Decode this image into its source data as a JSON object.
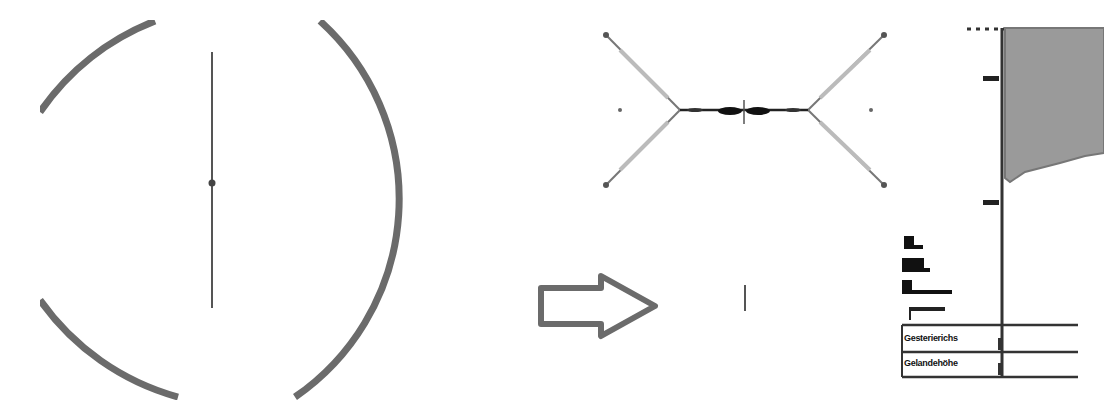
{
  "figure": {
    "panels": [
      {
        "id": "left",
        "description": "Circular cross-section with vertical line and center point"
      },
      {
        "id": "middle-top",
        "description": "X-shaped deformed structure with central horizontal band"
      },
      {
        "id": "middle-bottom",
        "description": "Short vertical tick"
      },
      {
        "id": "right",
        "description": "Profile plot with shaded region and labeled table"
      }
    ],
    "arrow": {
      "direction": "right",
      "color": "#6b6b6b"
    },
    "colors": {
      "stroke_dark": "#3a3a3a",
      "stroke_gray": "#6e6e6e",
      "fill_shaded": "#9a9a9a",
      "light_gray": "#b5b5b5"
    },
    "right_panel": {
      "legend_items": [
        "Ba",
        "Bkla",
        "Bhaaaa"
      ],
      "small_label": "gga.aaaa",
      "table_rows": [
        {
          "label": "Gesterierichs",
          "marker": "|"
        },
        {
          "label": "Gelandehöhe",
          "marker": "|"
        }
      ],
      "axis_ticks": 2
    }
  }
}
